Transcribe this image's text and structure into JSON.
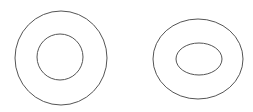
{
  "canvas": {
    "width": 253,
    "height": 112,
    "background": "#ffffff"
  },
  "stroke": {
    "color": "#555555",
    "width": 1
  },
  "shapes": [
    {
      "name": "left-ring",
      "outer": {
        "type": "circle",
        "cx": 61,
        "cy": 58,
        "rx": 46,
        "ry": 47
      },
      "inner": {
        "type": "circle",
        "cx": 60,
        "cy": 57,
        "rx": 23,
        "ry": 23
      }
    },
    {
      "name": "right-ring",
      "outer": {
        "type": "ellipse",
        "cx": 198,
        "cy": 59,
        "rx": 45,
        "ry": 40
      },
      "inner": {
        "type": "ellipse",
        "cx": 199,
        "cy": 59,
        "rx": 23,
        "ry": 16
      }
    }
  ]
}
